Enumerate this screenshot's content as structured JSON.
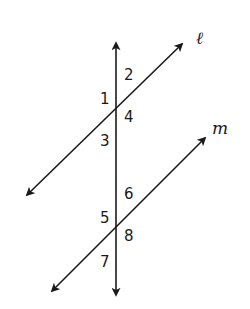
{
  "diagram": {
    "type": "parallel-lines-cut-by-transversal",
    "colors": {
      "stroke": "#1a1a1a",
      "background": "#ffffff"
    },
    "lines": [
      {
        "id": "l",
        "label": "ℓ",
        "x1": 27,
        "y1": 195,
        "x2": 182,
        "y2": 44,
        "label_x": 196,
        "label_y": 44
      },
      {
        "id": "m",
        "label": "m",
        "x1": 52,
        "y1": 291,
        "x2": 205,
        "y2": 138,
        "label_x": 212,
        "label_y": 134
      },
      {
        "id": "transversal",
        "label": "",
        "x1": 116,
        "y1": 295,
        "x2": 116,
        "y2": 43
      }
    ],
    "angles": [
      {
        "label": "1",
        "x": 100,
        "y": 104
      },
      {
        "label": "2",
        "x": 124,
        "y": 80
      },
      {
        "label": "3",
        "x": 100,
        "y": 146
      },
      {
        "label": "4",
        "x": 124,
        "y": 122
      },
      {
        "label": "5",
        "x": 100,
        "y": 223
      },
      {
        "label": "6",
        "x": 124,
        "y": 199
      },
      {
        "label": "7",
        "x": 100,
        "y": 267
      },
      {
        "label": "8",
        "x": 124,
        "y": 241
      }
    ]
  }
}
